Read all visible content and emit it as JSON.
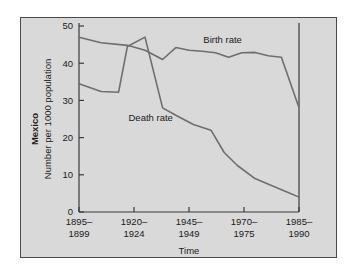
{
  "figure": {
    "panel_color": "#d9d9d9",
    "border_color": "#4a4a4a",
    "line_color": "#6e6e6e",
    "axis_color": "#3a3a3a"
  },
  "chart_data": {
    "type": "line",
    "title": "",
    "region_label": "Mexico",
    "xlabel": "Time",
    "ylabel": "Number per 1000 population",
    "ylim": [
      0,
      50
    ],
    "yticks": [
      0,
      10,
      20,
      30,
      40,
      50
    ],
    "ytick_labels": [
      "0",
      "10",
      "20",
      "30",
      "40",
      "50"
    ],
    "categories": [
      "1895–\n1899",
      "1920–\n1924",
      "1945–\n1949",
      "1970–\n1975",
      "1985–\n1990"
    ],
    "xtick_labels_top": [
      "1895–",
      "1920–",
      "1945–",
      "1970–",
      "1985–"
    ],
    "xtick_labels_bottom": [
      "1899",
      "1924",
      "1949",
      "1975",
      "1990"
    ],
    "grid": false,
    "legend_position": "inline-annotation",
    "series": [
      {
        "name": "Birth rate",
        "label_x": 0.565,
        "label_y": 45.5,
        "x": [
          0.0,
          0.1,
          0.22,
          0.3,
          0.38,
          0.44,
          0.5,
          0.56,
          0.62,
          0.68,
          0.74,
          0.8,
          0.86,
          0.92,
          1.0
        ],
        "values": [
          47.0,
          45.5,
          44.8,
          43.5,
          41.0,
          44.2,
          43.5,
          43.2,
          42.8,
          41.6,
          42.8,
          42.9,
          42.0,
          41.6,
          28.0
        ]
      },
      {
        "name": "Death rate",
        "label_x": 0.225,
        "label_y": 24.5,
        "x": [
          0.0,
          0.1,
          0.18,
          0.22,
          0.3,
          0.38,
          0.44,
          0.52,
          0.6,
          0.66,
          0.72,
          0.8,
          0.88,
          0.94,
          1.0
        ],
        "values": [
          34.5,
          32.4,
          32.2,
          44.5,
          47.0,
          28.0,
          26.0,
          23.5,
          22.0,
          16.0,
          12.5,
          9.0,
          7.0,
          5.5,
          4.0
        ]
      }
    ]
  }
}
